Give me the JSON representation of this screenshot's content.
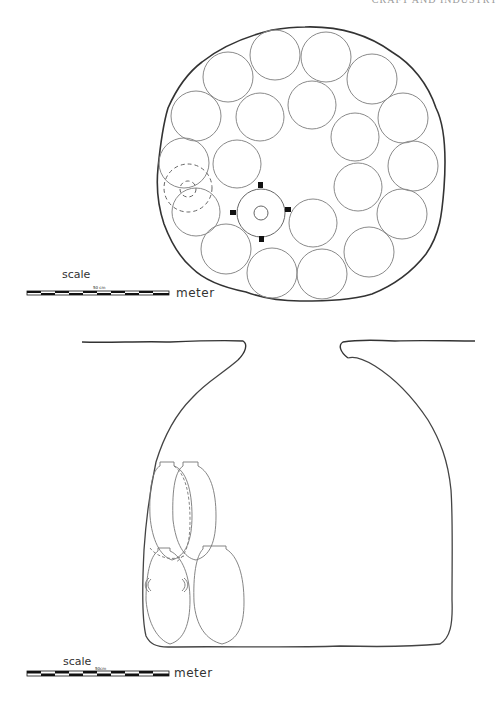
{
  "page": {
    "running_header": "CRAFT AND INDUSTRY"
  },
  "plan_view": {
    "description": "Plan of circular storage pit with arranged jar positions",
    "outline_color": "#333333",
    "circle_color": "#8a8a8a",
    "jar_circles": [
      {
        "cx": 228,
        "cy": 77,
        "r": 25
      },
      {
        "cx": 275,
        "cy": 55,
        "r": 25
      },
      {
        "cx": 326,
        "cy": 57,
        "r": 25
      },
      {
        "cx": 372,
        "cy": 79,
        "r": 25
      },
      {
        "cx": 196,
        "cy": 116,
        "r": 25
      },
      {
        "cx": 260,
        "cy": 117,
        "r": 24
      },
      {
        "cx": 312,
        "cy": 105,
        "r": 24
      },
      {
        "cx": 355,
        "cy": 137,
        "r": 24
      },
      {
        "cx": 403,
        "cy": 118,
        "r": 25
      },
      {
        "cx": 184,
        "cy": 163,
        "r": 25
      },
      {
        "cx": 237,
        "cy": 164,
        "r": 24
      },
      {
        "cx": 413,
        "cy": 166,
        "r": 25
      },
      {
        "cx": 358,
        "cy": 187,
        "r": 24
      },
      {
        "cx": 196,
        "cy": 212,
        "r": 24
      },
      {
        "cx": 313,
        "cy": 223,
        "r": 24
      },
      {
        "cx": 402,
        "cy": 214,
        "r": 25
      },
      {
        "cx": 226,
        "cy": 249,
        "r": 25
      },
      {
        "cx": 369,
        "cy": 252,
        "r": 25
      },
      {
        "cx": 272,
        "cy": 273,
        "r": 25
      },
      {
        "cx": 322,
        "cy": 274,
        "r": 25
      }
    ],
    "dashed_circles": [
      {
        "cx": 188,
        "cy": 188,
        "r": 24
      },
      {
        "cx": 188,
        "cy": 189,
        "r": 8
      }
    ],
    "central_post": {
      "cx": 261,
      "cy": 213,
      "r_outer": 24,
      "r_inner": 7
    }
  },
  "plan_scale": {
    "label": "scale",
    "mid_label": "50 cm",
    "unit": "meter"
  },
  "section_view": {
    "description": "Cross-section of bell-shaped storage pit with jars",
    "jars_count": 4
  },
  "section_scale": {
    "label": "scale",
    "mid_label": "50cm",
    "unit": "meter"
  }
}
